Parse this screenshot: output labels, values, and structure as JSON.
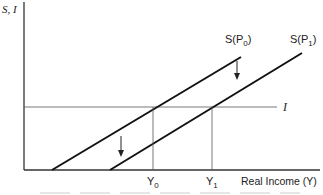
{
  "diagram": {
    "y_axis_label": "S, I",
    "x_axis_label": "Real Income (Y)",
    "curves": [
      {
        "name": "S(P0)",
        "label_main": "S(P",
        "label_sub": "0",
        "label_close": ")"
      },
      {
        "name": "S(P1)",
        "label_main": "S(P",
        "label_sub": "1",
        "label_close": ")"
      }
    ],
    "investment_line_label": "I",
    "x_ticks": [
      {
        "main": "Y",
        "sub": "0"
      },
      {
        "main": "Y",
        "sub": "1"
      }
    ],
    "shift_direction": "down",
    "colors": {
      "line": "#111111",
      "axis": "#333333",
      "guide": "#555555"
    }
  }
}
